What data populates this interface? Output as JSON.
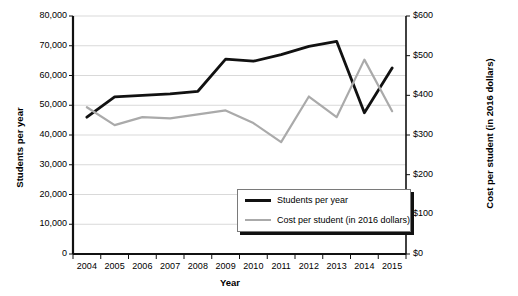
{
  "chart_data": {
    "type": "line",
    "title": "",
    "xlabel": "Year",
    "ylabel": "Students per year",
    "ylabel_right": "Cost per student (in 2016 dollars)",
    "categories": [
      "2004",
      "2005",
      "2006",
      "2007",
      "2008",
      "2009",
      "2010",
      "2011",
      "2012",
      "2013",
      "2014",
      "2015"
    ],
    "x": [
      2004,
      2005,
      2006,
      2007,
      2008,
      2009,
      2010,
      2011,
      2012,
      2013,
      2014,
      2015
    ],
    "ylim": [
      0,
      80000
    ],
    "ylim_right": [
      0,
      600
    ],
    "yticks": [
      "0",
      "10,000",
      "20,000",
      "30,000",
      "40,000",
      "50,000",
      "60,000",
      "70,000",
      "80,000"
    ],
    "ytick_values": [
      0,
      10000,
      20000,
      30000,
      40000,
      50000,
      60000,
      70000,
      80000
    ],
    "yticks_right": [
      "$0",
      "$100",
      "$200",
      "$300",
      "$400",
      "$500",
      "$600"
    ],
    "ytick_values_right": [
      0,
      100,
      200,
      300,
      400,
      500,
      600
    ],
    "grid": true,
    "legend_position": "bottom-right",
    "series": [
      {
        "name": "Students per year",
        "axis": "left",
        "color": "#111111",
        "values": [
          46000,
          52800,
          53300,
          53800,
          54700,
          65500,
          64800,
          67000,
          69800,
          71500,
          47500,
          62500
        ]
      },
      {
        "name": "Cost per student (in 2016 dollars)",
        "axis": "right",
        "color": "#aaaaaa",
        "values": [
          370,
          325,
          345,
          342,
          352,
          362,
          330,
          282,
          397,
          345,
          490,
          360
        ]
      }
    ]
  },
  "legend": {
    "items": [
      {
        "label": "Students per year"
      },
      {
        "label": "Cost per student (in 2016 dollars)"
      }
    ]
  },
  "colors": {
    "students_line": "#111111",
    "cost_line": "#aaaaaa",
    "gridline": "#d9d9d9",
    "axis": "#111111",
    "background": "#ffffff"
  }
}
